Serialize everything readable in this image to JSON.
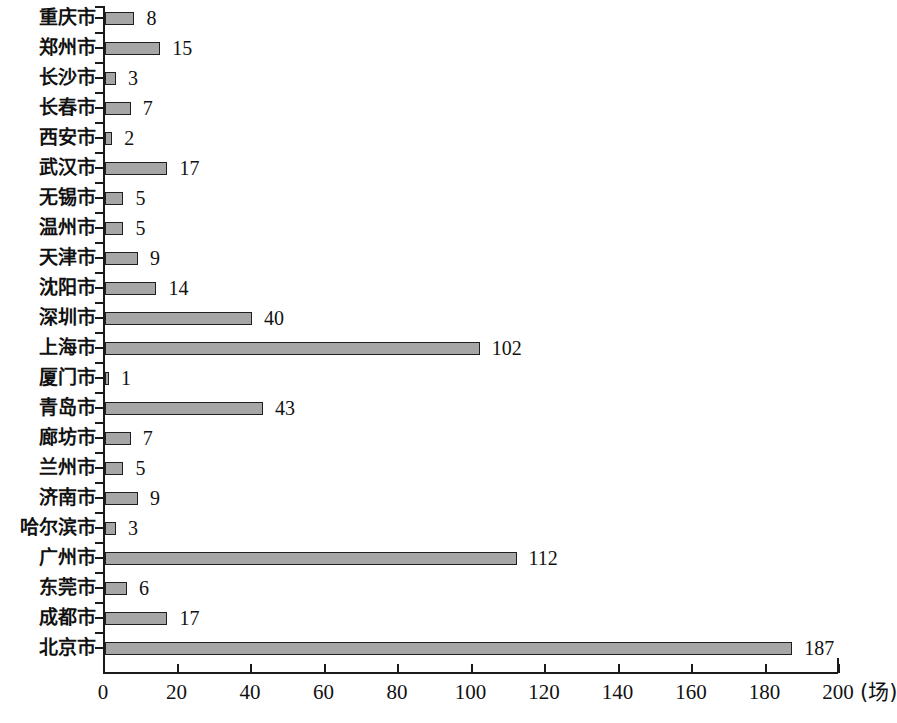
{
  "chart_data": {
    "type": "bar",
    "orientation": "horizontal",
    "title": "",
    "xlabel": "(场)",
    "ylabel": "",
    "xlim": [
      0,
      200
    ],
    "xticks": [
      0,
      20,
      40,
      60,
      80,
      100,
      120,
      140,
      160,
      180,
      200
    ],
    "xtick_labels": [
      "0",
      "20",
      "40",
      "60",
      "80",
      "100",
      "120",
      "140",
      "160",
      "180",
      "200"
    ],
    "unit": "(场)",
    "grid": false,
    "legend": false,
    "bar_color": "#a6a6a6",
    "bar_edge_color": "#1f1f1f",
    "value_labels_shown": true,
    "categories": [
      "重庆市",
      "郑州市",
      "长沙市",
      "长春市",
      "西安市",
      "武汉市",
      "无锡市",
      "温州市",
      "天津市",
      "沈阳市",
      "深圳市",
      "上海市",
      "厦门市",
      "青岛市",
      "廊坊市",
      "兰州市",
      "济南市",
      "哈尔滨市",
      "广州市",
      "东莞市",
      "成都市",
      "北京市"
    ],
    "values": [
      8,
      15,
      3,
      7,
      2,
      17,
      5,
      5,
      9,
      14,
      40,
      102,
      1,
      43,
      7,
      5,
      9,
      3,
      112,
      6,
      17,
      187
    ],
    "value_label_texts": [
      "8",
      "15",
      "3",
      "7",
      "2",
      "17",
      "5",
      "5",
      "9",
      "14",
      "40",
      "102",
      "1",
      "43",
      "7",
      "5",
      "9",
      "3",
      "112",
      "6",
      "17",
      "187"
    ]
  }
}
